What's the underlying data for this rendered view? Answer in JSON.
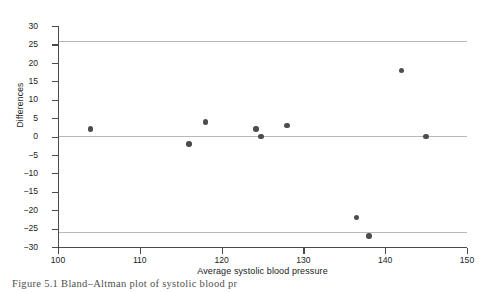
{
  "figure": {
    "caption": "Figure 5.1   Bland–Altman plot of systolic blood pr"
  },
  "chart_data": {
    "type": "scatter",
    "title": "",
    "xlabel": "Average systolic blood pressure",
    "ylabel": "Differences",
    "xlim": [
      100,
      150
    ],
    "ylim": [
      -30,
      30
    ],
    "xticks": [
      100,
      110,
      120,
      130,
      140,
      150
    ],
    "yticks": [
      -30,
      -25,
      -20,
      -15,
      -10,
      -5,
      0,
      5,
      10,
      15,
      20,
      25,
      30
    ],
    "xtick_labels": [
      "100",
      "110",
      "120",
      "130",
      "140",
      "150"
    ],
    "ytick_labels": [
      "-30",
      "-25",
      "-20",
      "-15",
      "-10",
      "-5",
      "0",
      "5",
      "10",
      "15",
      "20",
      "25",
      "30"
    ],
    "grid": false,
    "legend": null,
    "marker_color": "#4d4d4d",
    "reference_line_color": "#b9b9b9",
    "axis_color": "#4a4a4a",
    "reference_lines": [
      {
        "name": "upper-limit-of-agreement",
        "y": 26
      },
      {
        "name": "mean-difference",
        "y": 0.2
      },
      {
        "name": "lower-limit-of-agreement",
        "y": -26
      }
    ],
    "x": [
      104,
      116,
      118,
      124.2,
      124.8,
      128,
      136.5,
      138,
      142,
      145
    ],
    "y": [
      2,
      -2,
      4,
      2,
      0,
      3,
      -22,
      -27,
      18,
      0
    ],
    "points": [
      {
        "x": 104,
        "y": 2
      },
      {
        "x": 116,
        "y": -2
      },
      {
        "x": 118,
        "y": 4
      },
      {
        "x": 124.2,
        "y": 2
      },
      {
        "x": 124.8,
        "y": 0
      },
      {
        "x": 128,
        "y": 3
      },
      {
        "x": 136.5,
        "y": -22
      },
      {
        "x": 138,
        "y": -27
      },
      {
        "x": 142,
        "y": 18
      },
      {
        "x": 145,
        "y": 0
      }
    ]
  }
}
